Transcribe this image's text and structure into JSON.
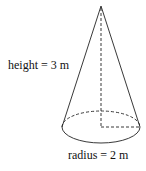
{
  "diagram": {
    "shape": "cone",
    "labels": {
      "height": "height = 3 m",
      "radius": "radius = 2 m"
    },
    "colors": {
      "stroke": "#222222",
      "background": "#ffffff"
    }
  }
}
